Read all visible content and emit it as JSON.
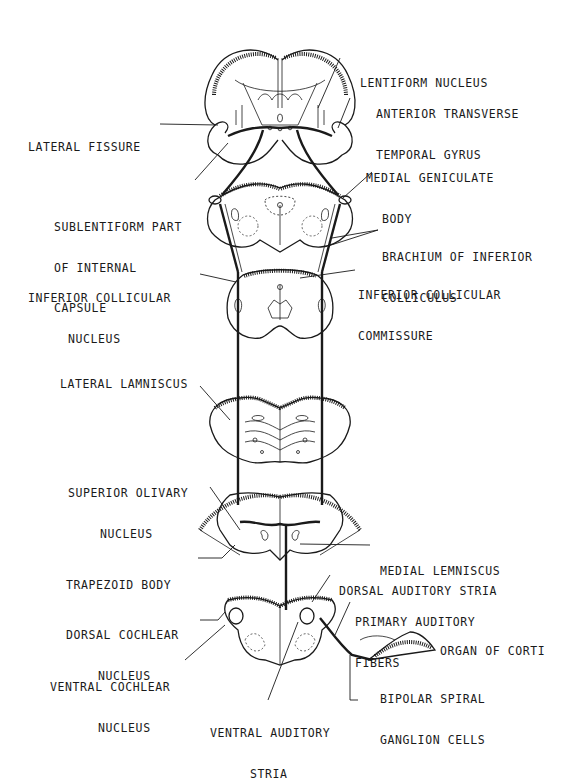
{
  "diagram": {
    "labels": {
      "lentiform_nucleus": [
        "LENTIFORM NUCLEUS"
      ],
      "anterior_transverse_temporal_gyrus": [
        "ANTERIOR TRANSVERSE",
        "TEMPORAL GYRUS"
      ],
      "lateral_fissure": [
        "LATERAL FISSURE"
      ],
      "sublentiform_part": [
        "SUBLENTIFORM PART",
        "OF INTERNAL",
        "CAPSULE"
      ],
      "medial_geniculate_body": [
        "MEDIAL GENICULATE",
        "BODY"
      ],
      "brachium_inferior_colliculus": [
        "BRACHIUM OF INFERIOR",
        "COLLICULUS"
      ],
      "inferior_collicular_nucleus": [
        "INFERIOR COLLICULAR",
        "NUCLEUS"
      ],
      "inferior_collicular_commissure": [
        "INFERIOR COLLICULAR",
        "COMMISSURE"
      ],
      "lateral_lemniscus": [
        "LATERAL LAMNISCUS"
      ],
      "superior_olivary_nucleus": [
        "SUPERIOR OLIVARY",
        "NUCLEUS"
      ],
      "medial_lemniscus": [
        "MEDIAL LEMNISCUS"
      ],
      "trapezoid_body": [
        "TRAPEZOID BODY"
      ],
      "dorsal_auditory_stria": [
        "DORSAL AUDITORY STRIA"
      ],
      "primary_auditory_fibers": [
        "PRIMARY AUDITORY",
        "FIBERS"
      ],
      "organ_of_corti": [
        "ORGAN OF CORTI"
      ],
      "dorsal_cochlear_nucleus": [
        "DORSAL COCHLEAR",
        "NUCLEUS"
      ],
      "ventral_cochlear_nucleus": [
        "VENTRAL COCHLEAR",
        "NUCLEUS"
      ],
      "bipolar_spiral_ganglion": [
        "BIPOLAR SPIRAL",
        "GANGLION CELLS"
      ],
      "ventral_auditory_stria": [
        "VENTRAL AUDITORY",
        "STRIA"
      ]
    }
  }
}
